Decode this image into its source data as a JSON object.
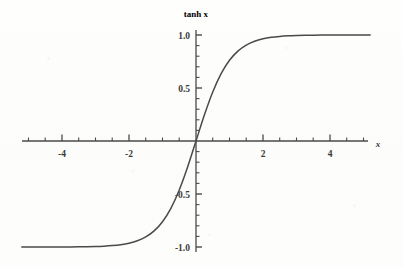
{
  "chart_data": {
    "type": "line",
    "title": "tanh x",
    "xlabel": "x",
    "ylabel": "tanh x",
    "grid": false,
    "legend": "none",
    "xlim": [
      -5.2,
      5.2
    ],
    "ylim": [
      -1.1,
      1.1
    ],
    "x_ticks_major": [
      -4,
      -2,
      2,
      4
    ],
    "x_tick_labels": [
      "-4",
      "-2",
      "2",
      "4"
    ],
    "x_minor_tick_step": 0.5,
    "y_ticks_major": [
      -1.0,
      -0.5,
      0.5,
      1.0
    ],
    "y_tick_labels": [
      "-1.0",
      "-0.5",
      "0.5",
      "1.0"
    ],
    "y_minor_tick_step": 0.1,
    "series": [
      {
        "name": "tanh x",
        "color": "#4a4a4a",
        "x": [
          -5.2,
          -5.0,
          -4.75,
          -4.5,
          -4.25,
          -4.0,
          -3.75,
          -3.5,
          -3.25,
          -3.0,
          -2.75,
          -2.5,
          -2.25,
          -2.0,
          -1.75,
          -1.5,
          -1.25,
          -1.0,
          -0.75,
          -0.5,
          -0.25,
          0.0,
          0.25,
          0.5,
          0.75,
          1.0,
          1.25,
          1.5,
          1.75,
          2.0,
          2.25,
          2.5,
          2.75,
          3.0,
          3.25,
          3.5,
          3.75,
          4.0,
          4.25,
          4.5,
          4.75,
          5.0,
          5.2
        ],
        "y": [
          -0.9999,
          -0.9999,
          -0.9999,
          -0.9998,
          -0.9996,
          -0.9993,
          -0.9989,
          -0.9982,
          -0.997,
          -0.9951,
          -0.9919,
          -0.9866,
          -0.978,
          -0.964,
          -0.9414,
          -0.9051,
          -0.8483,
          -0.7616,
          -0.6351,
          -0.4621,
          -0.2449,
          0.0,
          0.2449,
          0.4621,
          0.6351,
          0.7616,
          0.8483,
          0.9051,
          0.9414,
          0.964,
          0.978,
          0.9866,
          0.9919,
          0.9951,
          0.997,
          0.9982,
          0.9989,
          0.9993,
          0.9996,
          0.9998,
          0.9999,
          0.9999,
          0.9999
        ]
      }
    ],
    "annotations": [],
    "axis_color": "#4a4a4a",
    "background": "#fdfdfc"
  },
  "labels": {
    "y_axis_title": "tanh x",
    "x_axis_title": "x",
    "y_1_0": "1.0",
    "y_0_5": "0.5",
    "y_neg_0_5": "-0.5",
    "y_neg_1_0": "-1.0",
    "x_neg_4": "-4",
    "x_neg_2": "-2",
    "x_2": "2",
    "x_4": "4"
  }
}
